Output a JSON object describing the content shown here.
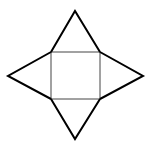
{
  "diagram": {
    "type": "square-pyramid-net",
    "background": "#ffffff",
    "stroke_outer": "#000000",
    "stroke_inner": "#333333",
    "square_base": {
      "x1": 51,
      "y1": 52,
      "x2": 100,
      "y2": 99
    },
    "apexes": {
      "top": [
        75,
        11
      ],
      "left": [
        8,
        76
      ],
      "right": [
        143,
        76
      ],
      "bottom": [
        75,
        139
      ]
    }
  }
}
